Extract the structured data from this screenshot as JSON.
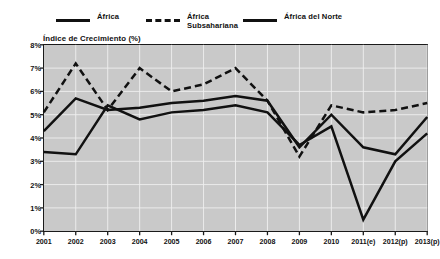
{
  "chart_data": {
    "type": "line",
    "title": "",
    "ylabel": "Índice de Crecimiento (%)",
    "xlabel": "",
    "x": [
      "2001",
      "2002",
      "2003",
      "2004",
      "2005",
      "2006",
      "2007",
      "2008",
      "2009",
      "2010",
      "2011(e)",
      "2012(p)",
      "2013(p)"
    ],
    "categories": [
      "2001",
      "2002",
      "2003",
      "2004",
      "2005",
      "2006",
      "2007",
      "2008",
      "2009",
      "2010",
      "2011(e)",
      "2012(p)",
      "2013(p)"
    ],
    "ylim": [
      0,
      8
    ],
    "ytick_labels": [
      "0%",
      "1%",
      "2%",
      "3%",
      "4%",
      "5%",
      "6%",
      "7%",
      "8%"
    ],
    "ytick_values": [
      0,
      1,
      2,
      3,
      4,
      5,
      6,
      7,
      8
    ],
    "grid": true,
    "legend_position": "top",
    "series": [
      {
        "name": "África",
        "style": "solid",
        "color": "#111111",
        "values": [
          4.3,
          5.7,
          5.2,
          5.3,
          5.5,
          5.6,
          5.8,
          5.6,
          3.6,
          5.0,
          3.6,
          3.3,
          4.9
        ]
      },
      {
        "name": "África Subsahariana",
        "style": "dashed",
        "color": "#111111",
        "values": [
          5.1,
          7.2,
          5.2,
          7.0,
          6.0,
          6.3,
          7.0,
          5.6,
          3.2,
          5.4,
          5.1,
          5.2,
          5.5
        ]
      },
      {
        "name": "África del Norte",
        "style": "solid",
        "color": "#111111",
        "values": [
          3.4,
          3.3,
          5.4,
          4.8,
          5.1,
          5.2,
          5.4,
          5.1,
          3.7,
          4.5,
          0.5,
          3.0,
          4.2
        ]
      }
    ]
  },
  "legend": {
    "items": [
      {
        "label": "África",
        "style": "solid"
      },
      {
        "label": "África\nSubsahariana",
        "style": "dashed"
      },
      {
        "label": "África del Norte",
        "style": "solid"
      }
    ]
  }
}
